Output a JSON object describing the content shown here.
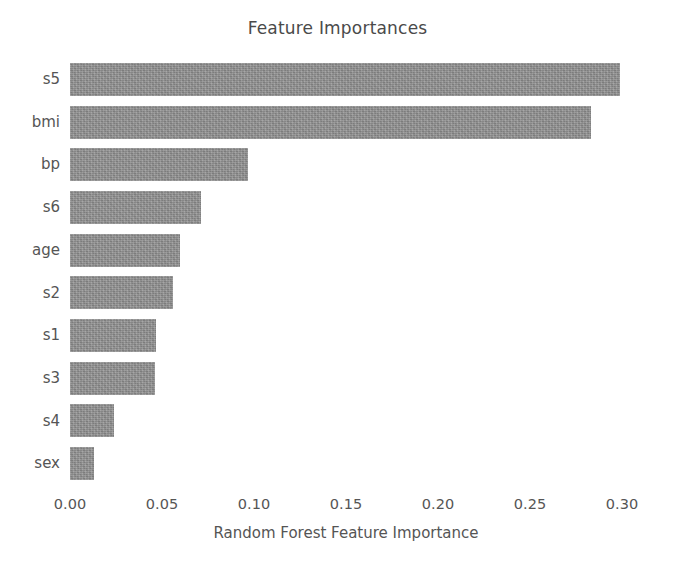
{
  "chart_data": {
    "type": "bar",
    "orientation": "horizontal",
    "title": "Feature Importances",
    "xlabel": "Random Forest Feature Importance",
    "ylabel": "",
    "categories": [
      "s5",
      "bmi",
      "bp",
      "s6",
      "age",
      "s2",
      "s1",
      "s3",
      "s4",
      "sex"
    ],
    "values": [
      0.299,
      0.283,
      0.097,
      0.071,
      0.06,
      0.056,
      0.047,
      0.046,
      0.024,
      0.013
    ],
    "xlim": [
      0.0,
      0.3
    ],
    "xticks": [
      0.0,
      0.05,
      0.1,
      0.15,
      0.2,
      0.25,
      0.3
    ],
    "xtick_labels": [
      "0.00",
      "0.05",
      "0.10",
      "0.15",
      "0.20",
      "0.25",
      "0.30"
    ],
    "grid": false,
    "legend": null,
    "bar_color": "#8e8e8e",
    "background_color": "#ffffff",
    "text_color": "#555555"
  }
}
